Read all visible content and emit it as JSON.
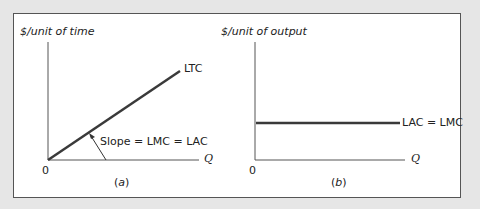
{
  "panel_a": {
    "y_axis_label": "$/unit of time",
    "x_axis_label": "Q",
    "origin_label": "0",
    "curve_label": "LTC",
    "annotation": "Slope = LMC = LAC",
    "caption_open": "(",
    "caption_letter": "a",
    "caption_close": ")"
  },
  "panel_b": {
    "y_axis_label": "$/unit of output",
    "x_axis_label": "Q",
    "origin_label": "0",
    "curve_label": "LAC = LMC",
    "caption_open": "(",
    "caption_letter": "b",
    "caption_close": ")"
  },
  "colors": {
    "curve": "#3a3a3a",
    "axis": "#555555",
    "background": "#e6e6e6",
    "panel": "#ffffff"
  }
}
